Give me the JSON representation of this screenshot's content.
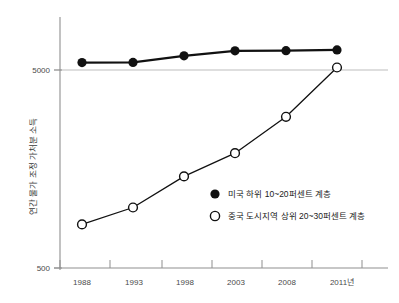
{
  "chart_data": {
    "type": "line",
    "title": "",
    "xlabel": "",
    "ylabel": "연간 물가 조정 가처분 소득",
    "x": [
      "1988",
      "1993",
      "1998",
      "2003",
      "2008",
      "2011년"
    ],
    "categories": [
      "1988",
      "1993",
      "1998",
      "2003",
      "2008",
      "2011년"
    ],
    "yscale": "log",
    "ylim": [
      500,
      7000
    ],
    "ytick_labels": [
      "5000",
      "500"
    ],
    "ytick_values": [
      5000,
      500
    ],
    "grid": "single horizontal gridline at 5000",
    "legend_position": "center-right inside plot",
    "series": [
      {
        "name": "미국 하위 10~20퍼센트 계층",
        "marker": "filled-circle",
        "color": "#111111",
        "values": [
          5450,
          5460,
          5900,
          6250,
          6260,
          6320
        ]
      },
      {
        "name": "중국 도시지역 상위 20~30퍼센트 계층",
        "marker": "open-circle",
        "color": "#111111",
        "values": [
          830,
          1010,
          1450,
          1900,
          2900,
          5150
        ]
      }
    ]
  },
  "axis": {
    "y_label_text": "연간 물가 조정 가처분 소득",
    "y_tick_top": "5000",
    "y_tick_bottom": "500",
    "x_ticks": [
      "1988",
      "1993",
      "1998",
      "2003",
      "2008",
      "2011년"
    ]
  },
  "legend": {
    "items": [
      {
        "marker": "filled-circle",
        "label": "미국 하위 10~20퍼센트 계층"
      },
      {
        "marker": "open-circle",
        "label": "중국 도시지역 상위 20~30퍼센트 계층"
      }
    ]
  },
  "colors": {
    "line": "#111111",
    "axis": "#8a8a8a",
    "grid": "#b8b8b8",
    "text": "#3a3a3a",
    "background": "#ffffff"
  }
}
